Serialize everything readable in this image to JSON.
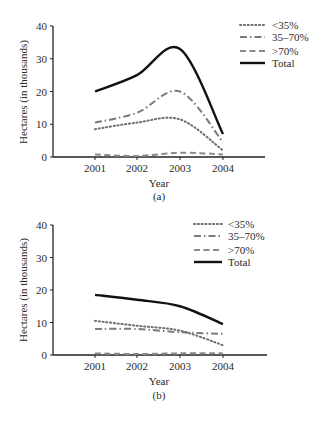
{
  "chart_data": [
    {
      "type": "line",
      "panel_label": "(a)",
      "title": "",
      "xlabel": "Year",
      "ylabel": "Hectares (in thousands)",
      "x": [
        "2001",
        "2002",
        "2003",
        "2004"
      ],
      "ylim": [
        0,
        40
      ],
      "yticks": [
        "0",
        "10",
        "20",
        "30",
        "40"
      ],
      "grid": false,
      "legend_position": "top-right",
      "series": [
        {
          "name": "<35%",
          "style": "dotted",
          "color": "#6e6e6e",
          "values": [
            8.5,
            10.5,
            11.5,
            2
          ]
        },
        {
          "name": "35–70%",
          "style": "dash-dot",
          "color": "#7a7a7a",
          "values": [
            10.5,
            13.5,
            20,
            4.5
          ]
        },
        {
          "name": ">70%",
          "style": "dashed",
          "color": "#8a8a8a",
          "values": [
            0.8,
            0.3,
            1.3,
            0.8
          ]
        },
        {
          "name": "Total",
          "style": "solid",
          "color": "#111111",
          "values": [
            20,
            25,
            33,
            7
          ]
        }
      ]
    },
    {
      "type": "line",
      "panel_label": "(b)",
      "title": "",
      "xlabel": "Year",
      "ylabel": "Hectares (in thousands)",
      "x": [
        "2001",
        "2002",
        "2003",
        "2004"
      ],
      "ylim": [
        0,
        40
      ],
      "yticks": [
        "0",
        "10",
        "20",
        "30",
        "40"
      ],
      "grid": false,
      "legend_position": "top-right",
      "series": [
        {
          "name": "<35%",
          "style": "dotted",
          "color": "#6e6e6e",
          "values": [
            10.5,
            9,
            7.5,
            3
          ]
        },
        {
          "name": "35–70%",
          "style": "dash-dot",
          "color": "#7a7a7a",
          "values": [
            8,
            8,
            7,
            6.5
          ]
        },
        {
          "name": ">70%",
          "style": "dashed",
          "color": "#8a8a8a",
          "values": [
            0.5,
            0.3,
            0.5,
            0.5
          ]
        },
        {
          "name": "Total",
          "style": "solid",
          "color": "#111111",
          "values": [
            18.5,
            17,
            15,
            9.5
          ]
        }
      ]
    }
  ]
}
